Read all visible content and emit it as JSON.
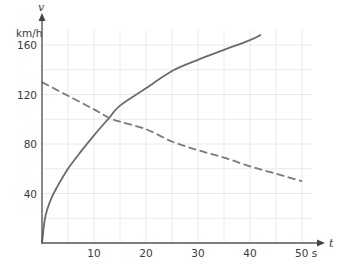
{
  "chart_data": {
    "type": "line",
    "title": "",
    "xlabel": "t",
    "ylabel": "v",
    "x_unit": "s",
    "y_unit": "km/h",
    "xlim": [
      0,
      52
    ],
    "ylim": [
      0,
      170
    ],
    "grid": true,
    "grid_x_step": 5,
    "grid_y_step": 20,
    "x_ticks": [
      10,
      20,
      30,
      40,
      50
    ],
    "x_tick_labels": [
      "10",
      "20",
      "30",
      "40",
      "50 s"
    ],
    "y_ticks": [
      40,
      80,
      120,
      160
    ],
    "y_tick_labels": [
      "40",
      "80",
      "120",
      "160"
    ],
    "legend": null,
    "series": [
      {
        "name": "solid curve",
        "style": "solid",
        "color": "#6b6b6b",
        "x": [
          0,
          0.5,
          1,
          2,
          3,
          5,
          7.5,
          10,
          12.9,
          15,
          20,
          25,
          30,
          35,
          40,
          42
        ],
        "y": [
          0,
          18,
          27,
          38,
          46,
          60,
          74,
          87,
          101,
          111,
          125,
          139,
          148,
          156,
          164,
          168
        ]
      },
      {
        "name": "dashed line",
        "style": "dashed",
        "color": "#7a7a7a",
        "x": [
          0,
          5,
          10,
          12.9,
          15,
          20,
          25,
          30,
          35,
          40,
          45,
          50
        ],
        "y": [
          130,
          119,
          108,
          101,
          98,
          92,
          82,
          75,
          69,
          62,
          56,
          50
        ]
      }
    ],
    "annotations": [
      {
        "text": "intersection",
        "x": 12.9,
        "y": 101
      }
    ]
  },
  "labels": {
    "y_axis_name": "v",
    "y_axis_unit": "km/h",
    "x_axis_name": "t"
  }
}
